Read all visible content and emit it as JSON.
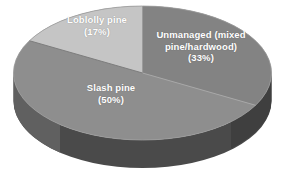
{
  "chart_data": {
    "type": "pie",
    "title": "",
    "subtitle": "",
    "xlabel": "",
    "ylabel": "",
    "legend_position": "none",
    "grid": false,
    "style": "3d-pie-grayscale",
    "labels_inside_slices": true,
    "categories": [
      "Unmanaged (mixed pine/hardwood)",
      "Slash pine",
      "Loblolly pine"
    ],
    "values": [
      33,
      50,
      17
    ],
    "value_unit": "percent",
    "slices": [
      {
        "name": "Unmanaged (mixed pine/hardwood)",
        "label_line1": "Unmanaged (mixed",
        "label_line2": "pine/hardwood)",
        "percent_label": "(33%)",
        "display_text": "Unmanaged (mixed\npine/hardwood)\n(33%)",
        "value": 33,
        "color": "#838383",
        "side_color": "#4d4d4d",
        "start_angle_deg": 0,
        "end_angle_deg": 118.8
      },
      {
        "name": "Slash pine",
        "label_line1": "Slash pine",
        "percent_label": "(50%)",
        "display_text": "Slash pine\n(50%)",
        "value": 50,
        "color": "#8e8e8e",
        "side_color": "#565656",
        "start_angle_deg": 118.8,
        "end_angle_deg": 298.8
      },
      {
        "name": "Loblolly pine",
        "label_line1": "Loblolly pine",
        "percent_label": "(17%)",
        "display_text": "Loblolly pine\n(17%)",
        "value": 17,
        "color": "#c5c5c5",
        "side_color": "#8a8a8a",
        "start_angle_deg": 298.8,
        "end_angle_deg": 360
      }
    ],
    "colors": {
      "background": "#ffffff",
      "unmanaged": "#838383",
      "slash_pine": "#8e8e8e",
      "loblolly_pine": "#c5c5c5",
      "base_dark": "#4a4a4a",
      "label_text": "#ffffff",
      "edge": "#9d9d9d"
    }
  }
}
